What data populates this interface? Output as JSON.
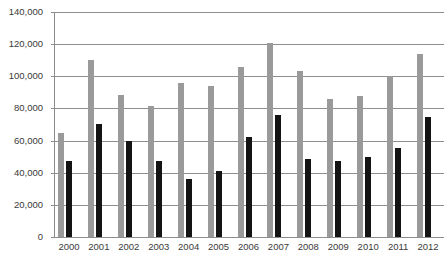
{
  "chart_data": {
    "type": "bar",
    "title": "",
    "xlabel": "",
    "ylabel": "",
    "ylim": [
      0,
      140000
    ],
    "ytick_labels": [
      "140,000",
      "120,000",
      "100,000",
      "80,000",
      "60,000",
      "40,000",
      "20,000",
      "0"
    ],
    "ytick_values": [
      140000,
      120000,
      100000,
      80000,
      60000,
      40000,
      20000,
      0
    ],
    "grid": true,
    "legend": "none",
    "categories": [
      "2000",
      "2001",
      "2002",
      "2003",
      "2004",
      "2005",
      "2006",
      "2007",
      "2008",
      "2009",
      "2010",
      "2011",
      "2012"
    ],
    "series": [
      {
        "name": "Series 1",
        "color": "#9a9a9a",
        "values": [
          64500,
          110000,
          88500,
          81500,
          96000,
          94000,
          106000,
          120500,
          103500,
          86000,
          87500,
          100000,
          114000
        ]
      },
      {
        "name": "Series 2",
        "color": "#141414",
        "values": [
          47000,
          70500,
          59500,
          47500,
          36000,
          41000,
          62000,
          76000,
          48500,
          47500,
          50000,
          55500,
          74500
        ]
      }
    ]
  },
  "colors": {
    "series_a": "#9a9a9a",
    "series_b": "#141414",
    "gridline": "#8e8e8e",
    "axis": "#8c8c8c",
    "text": "#3a3a3a",
    "background": "#ffffff"
  }
}
